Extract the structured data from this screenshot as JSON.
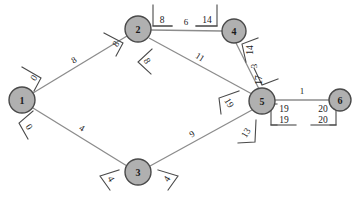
{
  "diagram": {
    "colors": {
      "node_fill": "#b0b0b0",
      "node_stroke": "#4a4a4a",
      "edge_stroke": "#8c8c8c",
      "text": "#1a1a1a",
      "background": "#ffffff"
    },
    "nodes": [
      {
        "id": "1",
        "label": "1",
        "cx": 22,
        "cy": 100,
        "r": 13
      },
      {
        "id": "2",
        "label": "2",
        "cx": 138,
        "cy": 29,
        "r": 13
      },
      {
        "id": "3",
        "label": "3",
        "cx": 138,
        "cy": 172,
        "r": 13
      },
      {
        "id": "4",
        "label": "4",
        "cx": 234,
        "cy": 31,
        "r": 12
      },
      {
        "id": "5",
        "label": "5",
        "cx": 262,
        "cy": 101,
        "r": 13
      },
      {
        "id": "6",
        "label": "6",
        "cx": 340,
        "cy": 100,
        "r": 11
      }
    ],
    "edges": [
      {
        "id": "e-1-2",
        "from": "1",
        "to": "2",
        "weight": "8",
        "wx": 74,
        "wy": 60,
        "wrot": -31
      },
      {
        "id": "e-1-3",
        "from": "1",
        "to": "3",
        "weight": "4",
        "wx": 82,
        "wy": 128,
        "wrot": 31
      },
      {
        "id": "e-2-4",
        "from": "2",
        "to": "4",
        "weight": "6",
        "wx": 186,
        "wy": 25,
        "wrot": 0
      },
      {
        "id": "e-2-5",
        "from": "2",
        "to": "5",
        "weight": "11",
        "wx": 200,
        "wy": 57,
        "wrot": 32
      },
      {
        "id": "e-3-5",
        "from": "3",
        "to": "5",
        "weight": "9",
        "wx": 192,
        "wy": 134,
        "wrot": -33
      },
      {
        "id": "e-4-5",
        "from": "4",
        "to": "5",
        "weight": "3",
        "wx": 254,
        "wy": 65,
        "wrot": -90
      },
      {
        "id": "e-5-6",
        "from": "5",
        "to": "6",
        "weight": "1",
        "wx": 302,
        "wy": 91,
        "wrot": 0
      }
    ],
    "distance_labels": [
      {
        "id": "d-1-a",
        "node": "1",
        "edge": "e-1-2",
        "value": "0",
        "x": 34,
        "y": 78,
        "rot": -58
      },
      {
        "id": "d-1-b",
        "node": "1",
        "edge": "e-1-3",
        "value": "0",
        "x": 29,
        "y": 127,
        "rot": 58
      },
      {
        "id": "d-2-a",
        "node": "2",
        "edge": "e-1-2",
        "value": "8",
        "x": 116,
        "y": 44,
        "rot": -58
      },
      {
        "id": "d-2-b",
        "node": "2",
        "edge": "e-2-5",
        "value": "8",
        "x": 147,
        "y": 61,
        "rot": 58
      },
      {
        "id": "d-2-c",
        "node": "2",
        "edge": "e-2-4",
        "value": "8",
        "x": 160,
        "y": 22,
        "rot": 0
      },
      {
        "id": "d-4-a",
        "node": "4",
        "edge": "e-2-4",
        "value": "14",
        "x": 208,
        "y": 22,
        "rot": 0
      },
      {
        "id": "d-4-b",
        "node": "4",
        "edge": "e-4-5",
        "value": "14",
        "x": 250,
        "y": 48,
        "rot": -90
      },
      {
        "id": "d-5-a",
        "node": "5",
        "edge": "e-4-5",
        "value": "17",
        "x": 258,
        "y": 80,
        "rot": -90
      },
      {
        "id": "d-5-b",
        "node": "5",
        "edge": "e-2-5",
        "value": "19",
        "x": 228,
        "y": 105,
        "rot": 58
      },
      {
        "id": "d-5-c",
        "node": "5",
        "edge": "e-3-5",
        "value": "13",
        "x": 246,
        "y": 135,
        "rot": -58
      },
      {
        "id": "d-3-a",
        "node": "3",
        "edge": "e-1-3",
        "value": "4",
        "x": 110,
        "y": 180,
        "rot": 58
      },
      {
        "id": "d-3-b",
        "node": "3",
        "edge": "e-3-5",
        "value": "4",
        "x": 168,
        "y": 180,
        "rot": -58
      }
    ],
    "stacked_labels": [
      {
        "id": "s-5",
        "node": "5",
        "top": "19",
        "bottom": "19",
        "x": 285,
        "y": 112,
        "bracket": "left"
      },
      {
        "id": "s-6",
        "node": "6",
        "top": "20",
        "bottom": "20",
        "x": 322,
        "y": 112,
        "bracket": "right"
      }
    ]
  }
}
